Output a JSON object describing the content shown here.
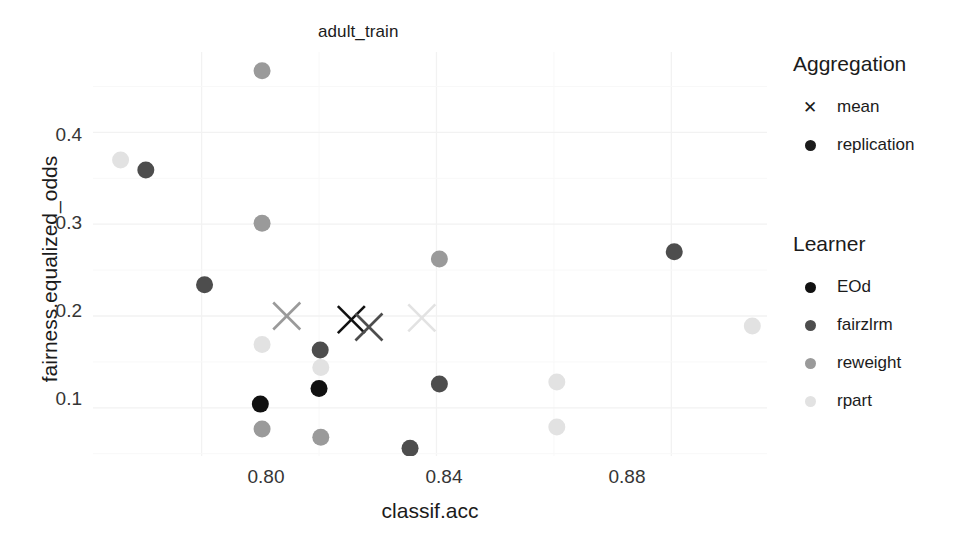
{
  "chart_data": {
    "type": "scatter",
    "title": "adult_train",
    "xlabel": "classif.acc",
    "ylabel": "fairness.equalized_odds",
    "xlim": [
      0.7815,
      0.8963
    ],
    "ylim": [
      0.0475,
      0.4875
    ],
    "xticks": [
      "0.80",
      "0.84",
      "0.88"
    ],
    "xtick_values": [
      0.8,
      0.84,
      0.88
    ],
    "yticks": [
      "0.1",
      "0.2",
      "0.3",
      "0.4"
    ],
    "ytick_values": [
      0.1,
      0.2,
      0.3,
      0.4
    ],
    "grid": true,
    "legend_position": "right",
    "legends": [
      {
        "title": "Aggregation",
        "entries": [
          {
            "label": "mean",
            "marker": "cross",
            "color": "#1b1b1b"
          },
          {
            "label": "replication",
            "marker": "circle",
            "color": "#1b1b1b"
          }
        ]
      },
      {
        "title": "Learner",
        "entries": [
          {
            "label": "EOd",
            "marker": "circle",
            "color": "#111111"
          },
          {
            "label": "fairzlrm",
            "marker": "circle",
            "color": "#4d4d4d"
          },
          {
            "label": "reweight",
            "marker": "circle",
            "color": "#9a9a9a"
          },
          {
            "label": "rpart",
            "marker": "circle",
            "color": "#e2e2e2"
          }
        ]
      }
    ],
    "series": [
      {
        "name": "EOd",
        "color": "#111111",
        "aggregation": "replication",
        "marker": "circle",
        "points": [
          {
            "x": 0.81,
            "y": 0.104
          },
          {
            "x": 0.82,
            "y": 0.121
          }
        ]
      },
      {
        "name": "EOd",
        "color": "#111111",
        "aggregation": "mean",
        "marker": "cross",
        "points": [
          {
            "x": 0.8255,
            "y": 0.196
          }
        ]
      },
      {
        "name": "fairzlrm",
        "color": "#4d4d4d",
        "aggregation": "replication",
        "marker": "circle",
        "points": [
          {
            "x": 0.7905,
            "y": 0.359
          },
          {
            "x": 0.8005,
            "y": 0.234
          },
          {
            "x": 0.8202,
            "y": 0.163
          },
          {
            "x": 0.8355,
            "y": 0.056
          },
          {
            "x": 0.8405,
            "y": 0.126
          },
          {
            "x": 0.8805,
            "y": 0.27
          }
        ]
      },
      {
        "name": "fairzlrm",
        "color": "#4d4d4d",
        "aggregation": "mean",
        "marker": "cross",
        "points": [
          {
            "x": 0.8285,
            "y": 0.188
          }
        ]
      },
      {
        "name": "reweight",
        "color": "#9a9a9a",
        "aggregation": "replication",
        "marker": "circle",
        "points": [
          {
            "x": 0.8103,
            "y": 0.467
          },
          {
            "x": 0.8103,
            "y": 0.301
          },
          {
            "x": 0.8103,
            "y": 0.077
          },
          {
            "x": 0.8203,
            "y": 0.068
          },
          {
            "x": 0.8405,
            "y": 0.262
          }
        ]
      },
      {
        "name": "reweight",
        "color": "#9a9a9a",
        "aggregation": "mean",
        "marker": "cross",
        "points": [
          {
            "x": 0.8145,
            "y": 0.2
          }
        ]
      },
      {
        "name": "rpart",
        "color": "#e2e2e2",
        "aggregation": "replication",
        "marker": "circle",
        "points": [
          {
            "x": 0.7862,
            "y": 0.37
          },
          {
            "x": 0.8103,
            "y": 0.169
          },
          {
            "x": 0.8203,
            "y": 0.144
          },
          {
            "x": 0.8605,
            "y": 0.128
          },
          {
            "x": 0.8605,
            "y": 0.079
          },
          {
            "x": 0.8938,
            "y": 0.189
          }
        ]
      },
      {
        "name": "rpart",
        "color": "#e2e2e2",
        "aggregation": "mean",
        "marker": "cross",
        "points": [
          {
            "x": 0.8375,
            "y": 0.198
          }
        ]
      }
    ]
  }
}
